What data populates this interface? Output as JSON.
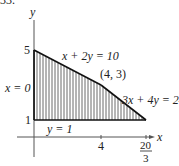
{
  "figure": {
    "number_label": "33.",
    "axes": {
      "x_label": "x",
      "y_label": "y",
      "y_ticks": [
        "5",
        "1"
      ],
      "x_ticks": [
        "4"
      ],
      "x_tick_frac": {
        "num": "20",
        "den": "3"
      }
    },
    "boundaries": {
      "line1": "x + 2y = 10",
      "line2": "3x + 4y = 24",
      "line3": "x = 0",
      "line4": "y = 1"
    },
    "vertex_label": "(4, 3)",
    "region": {
      "vertices": [
        [
          0,
          1
        ],
        [
          0,
          5
        ],
        [
          4,
          3
        ],
        [
          6.6667,
          1
        ]
      ],
      "fill": "vertical-hatch"
    },
    "colors": {
      "ink": "#222222",
      "background": "#ffffff"
    }
  }
}
